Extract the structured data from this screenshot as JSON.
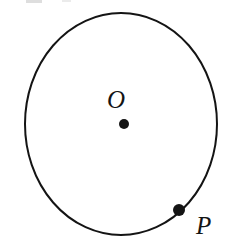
{
  "figure": {
    "kind": "circle-diagram",
    "background_color": "#ffffff",
    "stroke_color": "#141414",
    "dot_color": "#141414",
    "label_color": "#141414",
    "stroke_width": 2,
    "circle": {
      "center_x": 121,
      "center_y": 124,
      "radius_x": 96,
      "radius_y": 111
    },
    "points": [
      {
        "id": "center",
        "label": "O",
        "x": 124,
        "y": 124,
        "dot_radius": 5,
        "label_x": 119,
        "label_y": 99,
        "on_circle": false
      },
      {
        "id": "p",
        "label": "P",
        "x": 179,
        "y": 210,
        "dot_radius": 6,
        "label_x": 205,
        "label_y": 227,
        "on_circle": true
      }
    ]
  }
}
